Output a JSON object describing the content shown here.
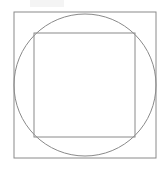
{
  "page": {
    "background_color": "#ffffff",
    "width": 164,
    "height": 169
  },
  "figure": {
    "name": "square-circle-square-diagram",
    "stroke_color": "#8a8a8a",
    "stroke_width": 1,
    "fill": "none",
    "artifact": {
      "name": "scan-smudge",
      "color": "#f2f2f2"
    }
  },
  "chart_data": {
    "type": "diagram",
    "title": "",
    "shapes": [
      {
        "name": "outer-square",
        "kind": "rect",
        "x": 14,
        "y": 12,
        "width": 142,
        "height": 146,
        "stroke": "#8a8a8a",
        "stroke_width": 1,
        "fill": "none"
      },
      {
        "name": "inscribed-circle",
        "kind": "circle",
        "cx": 85,
        "cy": 85,
        "r": 71,
        "stroke": "#8a8a8a",
        "stroke_width": 1,
        "fill": "none"
      },
      {
        "name": "inner-square",
        "kind": "rect",
        "x": 34,
        "y": 33,
        "width": 101,
        "height": 104,
        "stroke": "#8a8a8a",
        "stroke_width": 1,
        "fill": "none"
      }
    ],
    "labels": [],
    "legend": []
  }
}
